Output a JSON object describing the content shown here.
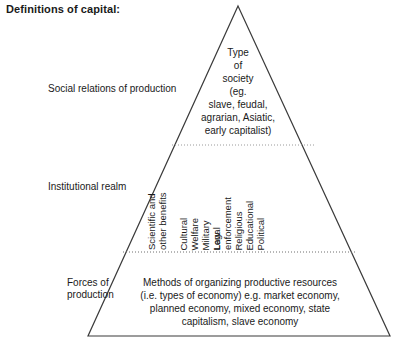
{
  "title": "Definitions of capital:",
  "diagram": {
    "shape": "triangle",
    "outline_color": "#3b3b3b",
    "divider_style": "dotted",
    "divider_color": "#8c8c8c",
    "tiers": [
      {
        "id": "social-relations",
        "left_label": "Social relations of production",
        "content": "Type\nof\nsociety\n(eg.\nslave, feudal,\nagrarian, Asiatic,\nearly capitalist)"
      },
      {
        "id": "institutional-realm",
        "left_label": "Institutional realm",
        "items": [
          "Scientific and\nother benefits",
          "Cultural",
          "Welfare",
          "Military",
          "Legal",
          "Law enforcement",
          "Religious",
          "Educational",
          "Political"
        ]
      },
      {
        "id": "forces-of-production",
        "left_label": "Forces of\nproduction",
        "content": "Methods of organizing productive resources\n(i.e. types of economy) e.g. market economy,\nplanned economy, mixed economy, state\ncapitalism, slave economy"
      }
    ]
  }
}
